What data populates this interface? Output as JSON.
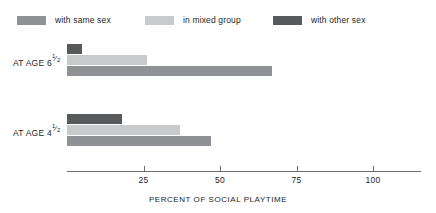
{
  "chart_data": {
    "type": "bar",
    "orientation": "horizontal",
    "title": "",
    "xlabel": "PERCENT OF SOCIAL PLAYTIME",
    "ylabel": "",
    "xlim": [
      0,
      115
    ],
    "xticks": [
      25,
      50,
      75,
      100
    ],
    "xtick_labels": [
      "25",
      "50",
      "75",
      "100"
    ],
    "grid": false,
    "legend_position": "top",
    "categories": [
      "AT AGE 6½",
      "AT AGE 4½"
    ],
    "series": [
      {
        "name": "with other sex",
        "color": "#58595b",
        "values": [
          5,
          18
        ]
      },
      {
        "name": "in mixed group",
        "color": "#c9cacc",
        "values": [
          26,
          37
        ]
      },
      {
        "name": "with same sex",
        "color": "#8f9194",
        "values": [
          67,
          47
        ]
      }
    ]
  },
  "legend": {
    "items": [
      {
        "label": "with same sex",
        "color": "#8f9194",
        "icon": "legend-swatch-icon"
      },
      {
        "label": "in mixed group",
        "color": "#c9cacc",
        "icon": "legend-swatch-icon"
      },
      {
        "label": "with other sex",
        "color": "#58595b",
        "icon": "legend-swatch-icon"
      }
    ]
  },
  "axis": {
    "x_title": "PERCENT OF SOCIAL PLAYTIME",
    "ticks": [
      "25",
      "50",
      "75",
      "100"
    ]
  },
  "groups": [
    {
      "label_prefix": "AT AGE 6",
      "numerator": "1",
      "slash": "⁄",
      "denominator": "2",
      "bars": [
        {
          "series": "with other sex",
          "value": 5,
          "color": "#58595b"
        },
        {
          "series": "in mixed group",
          "value": 26,
          "color": "#c9cacc"
        },
        {
          "series": "with same sex",
          "value": 67,
          "color": "#8f9194"
        }
      ]
    },
    {
      "label_prefix": "AT AGE 4",
      "numerator": "1",
      "slash": "⁄",
      "denominator": "2",
      "bars": [
        {
          "series": "with other sex",
          "value": 18,
          "color": "#58595b"
        },
        {
          "series": "in mixed group",
          "value": 37,
          "color": "#c9cacc"
        },
        {
          "series": "with same sex",
          "value": 47,
          "color": "#8f9194"
        }
      ]
    }
  ]
}
